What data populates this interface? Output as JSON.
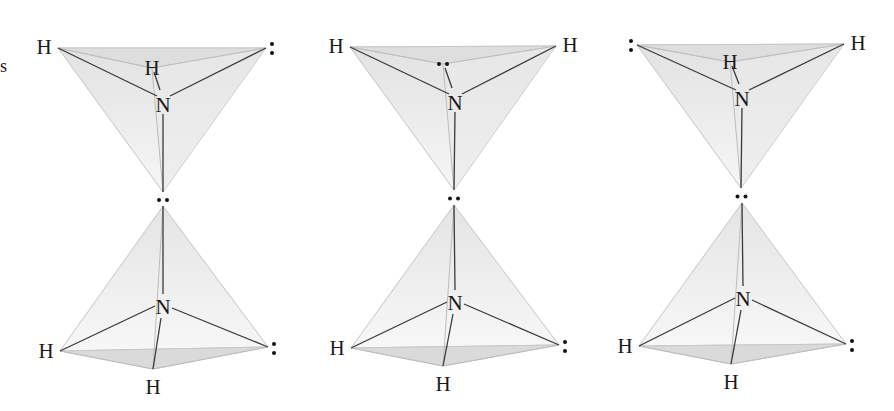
{
  "figure": {
    "edge_fragment": "s",
    "colors": {
      "face_fill": "#ececec",
      "face_fill_dark": "#dcdcdc",
      "light_edge": "#bdbdbd",
      "dark_edge": "#3a3a3a",
      "text": "#1a1a1a"
    },
    "panels": [
      {
        "name": "panel-1",
        "top": {
          "left_label": "H",
          "right_label": ":",
          "back_label": "H",
          "center_label": "N",
          "left": [
            58,
            48
          ],
          "right": [
            266,
            48
          ],
          "back": [
            152,
            68
          ],
          "center": [
            163,
            104
          ],
          "apex": [
            163,
            192
          ]
        },
        "junction_label": "··",
        "bottom": {
          "left_label": "H",
          "right_label": ":",
          "front_label": "H",
          "center_label": "N",
          "apex": [
            163,
            206
          ],
          "center": [
            163,
            306
          ],
          "left": [
            60,
            351
          ],
          "right": [
            268,
            347
          ],
          "front": [
            153,
            369
          ]
        }
      },
      {
        "name": "panel-2",
        "top": {
          "left_label": "H",
          "right_label": "H",
          "back_label": "··",
          "center_label": "N",
          "left": [
            350,
            47
          ],
          "right": [
            556,
            46
          ],
          "back": [
            443,
            64
          ],
          "center": [
            455,
            102
          ],
          "apex": [
            454,
            190
          ]
        },
        "junction_label": "··",
        "bottom": {
          "left_label": "H",
          "right_label": ":",
          "front_label": "H",
          "center_label": "N",
          "apex": [
            454,
            205
          ],
          "center": [
            455,
            302
          ],
          "left": [
            351,
            348
          ],
          "right": [
            559,
            345
          ],
          "front": [
            443,
            366
          ]
        }
      },
      {
        "name": "panel-3",
        "top": {
          "left_label": ":",
          "right_label": "H",
          "back_label": "H",
          "center_label": "N",
          "left": [
            637,
            45
          ],
          "right": [
            844,
            44
          ],
          "back": [
            730,
            62
          ],
          "center": [
            742,
            98
          ],
          "apex": [
            741,
            188
          ]
        },
        "junction_label": "··",
        "bottom": {
          "left_label": "H",
          "right_label": ":",
          "front_label": "H",
          "center_label": "N",
          "apex": [
            742,
            203
          ],
          "center": [
            743,
            298
          ],
          "left": [
            639,
            346
          ],
          "right": [
            846,
            344
          ],
          "front": [
            731,
            364
          ]
        }
      }
    ]
  }
}
